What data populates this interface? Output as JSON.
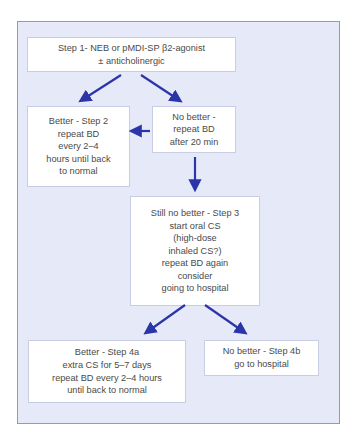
{
  "diagram": {
    "nodes": {
      "step1": "Step 1- NEB or pMDI-SP β2-agonist\n± anticholinergic",
      "step2": "Better - Step 2\nrepeat BD\nevery 2–4\nhours until back\nto normal",
      "no_better": "No better -\nrepeat BD\nafter 20 min",
      "step3": "Still no better - Step 3\nstart oral CS\n(high-dose\ninhaled CS?)\nrepeat BD again\nconsider\ngoing to hospital",
      "step4a": "Better - Step 4a\nextra CS for 5–7 days\nrepeat BD every 2–4 hours\nuntil back to normal",
      "step4b": "No better - Step 4b\ngo to hospital"
    },
    "edges": [
      {
        "from": "step1",
        "to": "step2"
      },
      {
        "from": "step1",
        "to": "no_better"
      },
      {
        "from": "no_better",
        "to": "step2"
      },
      {
        "from": "no_better",
        "to": "step3"
      },
      {
        "from": "step3",
        "to": "step4a"
      },
      {
        "from": "step3",
        "to": "step4b"
      }
    ],
    "colors": {
      "frame_bg": "#e6e9f7",
      "frame_border": "#8f95d6",
      "arrow": "#2b35a8",
      "box_bg": "#ffffff"
    }
  }
}
